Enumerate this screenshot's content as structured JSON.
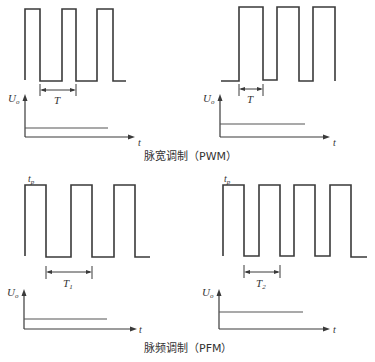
{
  "colors": {
    "ink": "#3a3a3a",
    "background": "#ffffff"
  },
  "captions": {
    "pwm": "脉宽调制（PWM）",
    "pfm": "脉频调制（PFM）"
  },
  "panels": [
    {
      "id": "pwm-narrow",
      "group": "PWM",
      "period_label": "T",
      "axis_y_label": "U",
      "axis_y_sub": "o",
      "axis_x_label": "t",
      "pulse_label": "",
      "duty": "narrow",
      "output_level": "low"
    },
    {
      "id": "pwm-wide",
      "group": "PWM",
      "period_label": "T",
      "axis_y_label": "U",
      "axis_y_sub": "o",
      "axis_x_label": "t",
      "pulse_label": "",
      "duty": "wide",
      "output_level": "higher"
    },
    {
      "id": "pfm-t1",
      "group": "PFM",
      "period_label": "T",
      "period_sub": "1",
      "axis_y_label": "U",
      "axis_y_sub": "o",
      "axis_x_label": "t",
      "pulse_label": "t",
      "pulse_sub": "p",
      "frequency": "low",
      "output_level": "low"
    },
    {
      "id": "pfm-t2",
      "group": "PFM",
      "period_label": "T",
      "period_sub": "2",
      "axis_y_label": "U",
      "axis_y_sub": "o",
      "axis_x_label": "t",
      "pulse_label": "t",
      "pulse_sub": "p",
      "frequency": "high",
      "output_level": "higher"
    }
  ]
}
